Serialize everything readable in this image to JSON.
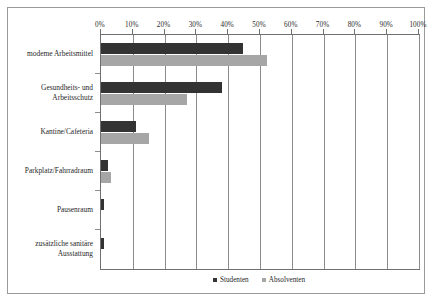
{
  "chart_data": {
    "type": "bar",
    "orientation": "horizontal",
    "title": "",
    "subtitle": "",
    "xlabel": "",
    "ylabel": "",
    "xlim": [
      0,
      100
    ],
    "grid": true,
    "legend_position": "bottom",
    "x_ticks": [
      0,
      10,
      20,
      30,
      40,
      50,
      60,
      70,
      80,
      90,
      100
    ],
    "x_tick_labels": [
      "0%",
      "10%",
      "20%",
      "30%",
      "40%",
      "50%",
      "60%",
      "70%",
      "80%",
      "90%",
      "100%"
    ],
    "categories": [
      "modeme Arbeitsmittel",
      "Gesundheits- und Arbeitsschutz",
      "Kantine/Cafeteria",
      "Parkplatz/Fahrradraum",
      "Pausenraum",
      "zusätzliche sanitäre Ausstattung"
    ],
    "series": [
      {
        "name": "Studenten",
        "color": "#333333",
        "values": [
          44.7,
          38.0,
          11.0,
          2.2,
          1.0,
          0.9
        ]
      },
      {
        "name": "Absolventen",
        "color": "#a6a6a6",
        "values": [
          52.2,
          27.0,
          15.0,
          3.1,
          0.0,
          0.0
        ]
      }
    ]
  },
  "style": {
    "bar_color_series_0": "#333333",
    "bar_color_series_1": "#a6a6a6",
    "gridline_color": "#8c8c8c",
    "axis_color": "#707070",
    "frame_border_color": "#9a9a9a",
    "background": "#ffffff"
  }
}
